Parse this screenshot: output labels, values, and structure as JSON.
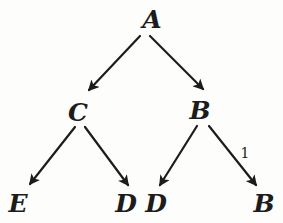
{
  "colors": {
    "ink": "#1c1c1c",
    "background": "#fdfdfc"
  },
  "diagram": {
    "type": "tree",
    "nodes": [
      {
        "id": "A",
        "label": "A",
        "x": 152,
        "y": 28
      },
      {
        "id": "C",
        "label": "C",
        "x": 78,
        "y": 121
      },
      {
        "id": "B1",
        "label": "B",
        "x": 200,
        "y": 119
      },
      {
        "id": "E",
        "label": "E",
        "x": 18,
        "y": 212
      },
      {
        "id": "D1",
        "label": "D",
        "x": 126,
        "y": 212
      },
      {
        "id": "D2",
        "label": "D",
        "x": 156,
        "y": 212
      },
      {
        "id": "B2",
        "label": "B",
        "x": 264,
        "y": 212
      }
    ],
    "edges": [
      {
        "from": "A",
        "to": "C",
        "x1": 140,
        "y1": 36,
        "x2": 89,
        "y2": 90,
        "label": ""
      },
      {
        "from": "A",
        "to": "B1",
        "x1": 150,
        "y1": 36,
        "x2": 203,
        "y2": 89,
        "label": ""
      },
      {
        "from": "C",
        "to": "E",
        "x1": 75,
        "y1": 127,
        "x2": 30,
        "y2": 184,
        "label": ""
      },
      {
        "from": "C",
        "to": "D1",
        "x1": 85,
        "y1": 127,
        "x2": 128,
        "y2": 185,
        "label": ""
      },
      {
        "from": "B1",
        "to": "D2",
        "x1": 197,
        "y1": 126,
        "x2": 160,
        "y2": 185,
        "label": ""
      },
      {
        "from": "B1",
        "to": "B2",
        "x1": 209,
        "y1": 126,
        "x2": 256,
        "y2": 185,
        "label": "1",
        "label_x": 245,
        "label_y": 158
      }
    ]
  }
}
